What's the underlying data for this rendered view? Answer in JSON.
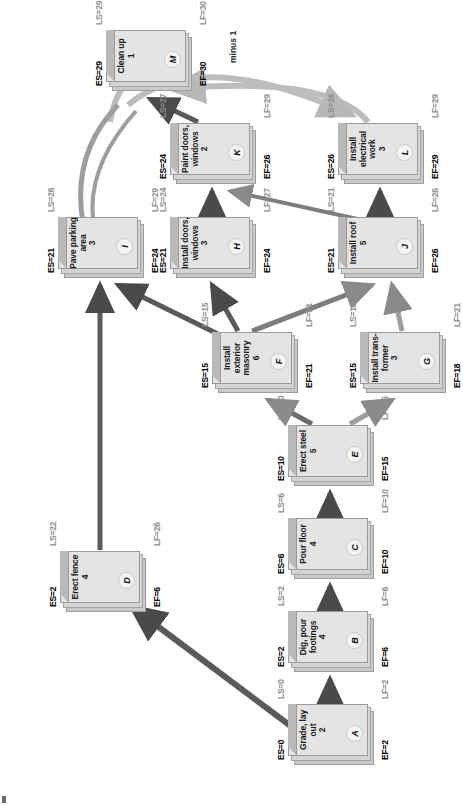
{
  "diagram": {
    "legend": {
      "es_prefix": "ES=",
      "ef_prefix": "EF=",
      "ls_prefix": "LS=",
      "lf_prefix": "LF="
    },
    "annotations": [
      {
        "id": "minus-one",
        "text": "minus 1"
      }
    ],
    "nodes": [
      {
        "id": "A",
        "name": "Grade, lay out",
        "duration": "2",
        "es": "ES=0",
        "ef": "EF=2",
        "ls": "LS=0",
        "lf": "LF=2"
      },
      {
        "id": "B",
        "name": "Dig, pour footings",
        "duration": "4",
        "es": "ES=2",
        "ef": "EF=6",
        "ls": "LS=2",
        "lf": "LF=6"
      },
      {
        "id": "C",
        "name": "Pour floor",
        "duration": "4",
        "es": "ES=6",
        "ef": "EF=10",
        "ls": "LS=6",
        "lf": "LF=10"
      },
      {
        "id": "D",
        "name": "Erect fence",
        "duration": "4",
        "es": "ES=2",
        "ef": "EF=6",
        "ls": "LS=22",
        "lf": "LF=26"
      },
      {
        "id": "E",
        "name": "Erect steel",
        "duration": "5",
        "es": "ES=10",
        "ef": "EF=15",
        "ls": "LS=10",
        "lf": "LF=15"
      },
      {
        "id": "F",
        "name": "Install exterior masonry",
        "duration": "6",
        "es": "ES=15",
        "ef": "EF=21",
        "ls": "LS=15",
        "lf": "LF=21"
      },
      {
        "id": "G",
        "name": "Install trans- former",
        "duration": "3",
        "es": "ES=15",
        "ef": "EF=18",
        "ls": "LS=18",
        "lf": "LF=21"
      },
      {
        "id": "H",
        "name": "Install doors, windows",
        "duration": "3",
        "es": "ES=21",
        "ef": "EF=24",
        "ls": "LS=24",
        "lf": "LF=27"
      },
      {
        "id": "I",
        "name": "Pave parking area",
        "duration": "3",
        "es": "ES=21",
        "ef": "EF=24",
        "ls": "LS=26",
        "lf": "LF=29"
      },
      {
        "id": "J",
        "name": "Install roof",
        "duration": "5",
        "es": "ES=21",
        "ef": "EF=26",
        "ls": "LS=21",
        "lf": "LF=26"
      },
      {
        "id": "K",
        "name": "Paint doors, windows",
        "duration": "2",
        "es": "ES=24",
        "ef": "EF=26",
        "ls": "LS=27",
        "lf": "LF=29"
      },
      {
        "id": "L",
        "name": "Install electrical work",
        "duration": "3",
        "es": "ES=26",
        "ef": "EF=29",
        "ls": "LS=26",
        "lf": "LF=29"
      },
      {
        "id": "M",
        "name": "Clean up",
        "duration": "1",
        "es": "ES=29",
        "ef": "EF=30",
        "ls": "LS=29",
        "lf": "LF=30"
      }
    ]
  }
}
